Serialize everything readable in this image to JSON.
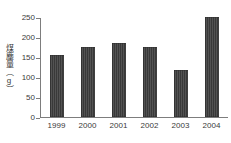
{
  "chart_data": {
    "type": "bar",
    "title": "",
    "subtitle": "",
    "xlabel": "",
    "ylabel": "煤塵量（g）",
    "ylabel_chars": [
      "煤",
      "塵",
      "量"
    ],
    "ylabel_unit": "（g）",
    "categories": [
      "1999",
      "2000",
      "2001",
      "2002",
      "2003",
      "2004"
    ],
    "values": [
      155,
      175,
      185,
      175,
      118,
      250
    ],
    "series": [
      {
        "name": "煤塵量",
        "values": [
          155,
          175,
          185,
          175,
          118,
          250
        ]
      }
    ],
    "ylim": [
      0,
      250
    ],
    "yticks": [
      0,
      50,
      100,
      150,
      200,
      250
    ],
    "ytick_labels": [
      "0",
      "50",
      "100",
      "150",
      "200",
      "250"
    ],
    "xlim_categories": 6,
    "grid": false,
    "legend": false,
    "legend_position": "none",
    "bar_color": "#393939",
    "axis_color": "#7d7d7d",
    "text_color": "#3a3a3a",
    "background_color": "#ffffff"
  }
}
